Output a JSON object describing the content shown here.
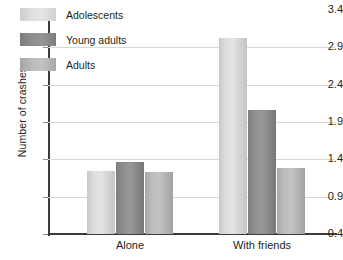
{
  "chart_data": {
    "type": "bar",
    "title": "",
    "xlabel": "",
    "ylabel": "Number of crashes",
    "categories": [
      "Alone",
      "With friends"
    ],
    "series": [
      {
        "name": "Adolescents",
        "values": [
          1.25,
          3.02
        ],
        "color": "#dcdcdc"
      },
      {
        "name": "Young adults",
        "values": [
          1.37,
          2.06
        ],
        "color": "#8d8d8d"
      },
      {
        "name": "Adults",
        "values": [
          1.23,
          1.28
        ],
        "color": "#b8b8b8"
      }
    ],
    "ylim": [
      0.4,
      3.4
    ],
    "ytick_labels": [
      "0.4",
      "0.9",
      "1.4",
      "1.9",
      "2.4",
      "2.9",
      "3.4"
    ],
    "ytick_values": [
      0.4,
      0.9,
      1.4,
      1.9,
      2.4,
      2.9,
      3.4
    ],
    "grid": true,
    "legend_position": "top-left"
  },
  "legend": {
    "items": [
      {
        "label": "Adolescents"
      },
      {
        "label": "Young adults"
      },
      {
        "label": "Adults"
      }
    ]
  },
  "axes": {
    "y_title": "Number of crashes",
    "y_ticks": [
      "0.4",
      "0.9",
      "1.4",
      "1.9",
      "2.4",
      "2.9",
      "3.4"
    ],
    "x_ticks": [
      "Alone",
      "With friends"
    ]
  }
}
